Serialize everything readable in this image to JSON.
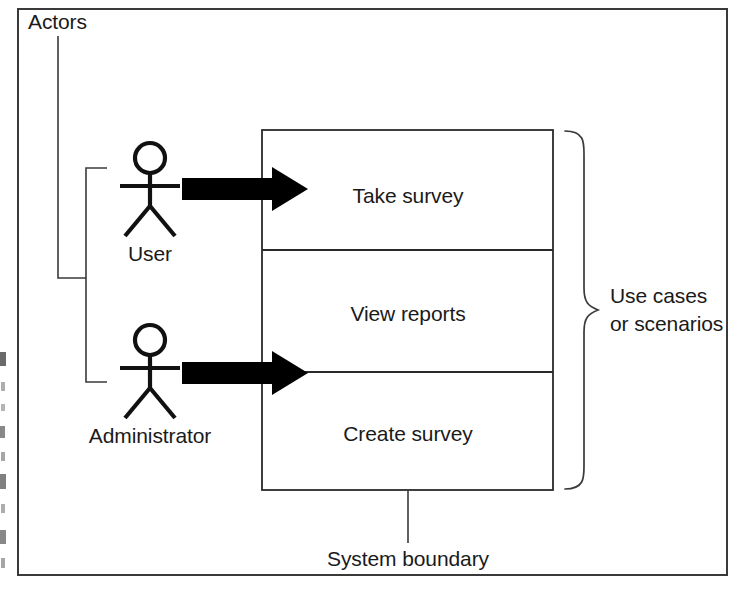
{
  "figure": {
    "width": 735,
    "height": 590,
    "background_color": "#ffffff",
    "line_color": "#3a3a3a",
    "text_color": "#1a1a1a",
    "arrow_color": "#000000"
  },
  "annotations": {
    "actors_label": "Actors",
    "use_cases_label_line1": "Use cases",
    "use_cases_label_line2": "or scenarios",
    "system_boundary_label": "System boundary"
  },
  "actors": [
    {
      "id": "user",
      "label": "User",
      "icon": "stick-figure-icon"
    },
    {
      "id": "administrator",
      "label": "Administrator",
      "icon": "stick-figure-icon"
    }
  ],
  "use_cases": [
    {
      "id": "take-survey",
      "label": "Take survey"
    },
    {
      "id": "view-reports",
      "label": "View reports"
    },
    {
      "id": "create-survey",
      "label": "Create survey"
    }
  ],
  "associations": [
    {
      "from": "user",
      "to": "take-survey",
      "style": "solid-block-arrow"
    },
    {
      "from": "administrator",
      "to": "create-survey",
      "style": "solid-block-arrow"
    }
  ]
}
